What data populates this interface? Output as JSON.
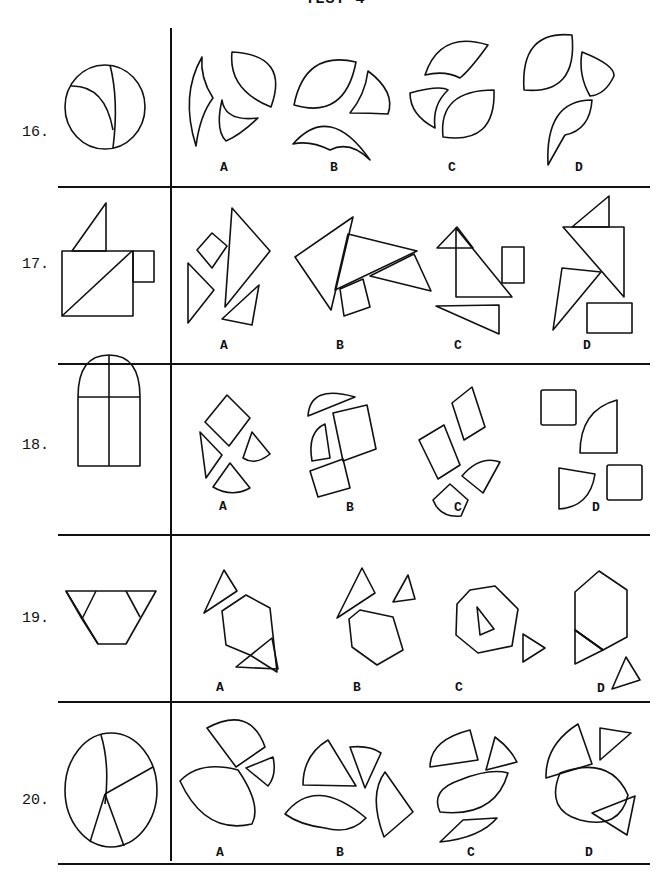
{
  "page": {
    "title": "TEST 4",
    "option_letters": [
      "A",
      "B",
      "C",
      "D"
    ]
  },
  "questions": [
    {
      "number": "16.",
      "model_figure": "circle divided into three curved pieces",
      "options": [
        {
          "label": "A"
        },
        {
          "label": "B"
        },
        {
          "label": "C"
        },
        {
          "label": "D"
        }
      ]
    },
    {
      "number": "17.",
      "model_figure": "square with diagonal, triangle on top, small rectangle at right",
      "options": [
        {
          "label": "A"
        },
        {
          "label": "B"
        },
        {
          "label": "C"
        },
        {
          "label": "D"
        }
      ]
    },
    {
      "number": "18.",
      "model_figure": "arched window divided into four panes",
      "options": [
        {
          "label": "A"
        },
        {
          "label": "B"
        },
        {
          "label": "C"
        },
        {
          "label": "D"
        }
      ]
    },
    {
      "number": "19.",
      "model_figure": "inverted trapezoid composed of a hexagon and two triangles",
      "options": [
        {
          "label": "A"
        },
        {
          "label": "B"
        },
        {
          "label": "C"
        },
        {
          "label": "D"
        }
      ]
    },
    {
      "number": "20.",
      "model_figure": "oval divided into four pieces",
      "options": [
        {
          "label": "A"
        },
        {
          "label": "B"
        },
        {
          "label": "C"
        },
        {
          "label": "D"
        }
      ]
    }
  ]
}
